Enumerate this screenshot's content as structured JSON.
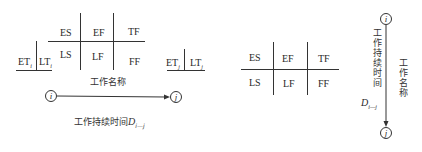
{
  "diagram_left": {
    "table_labels": {
      "es": "ES",
      "ef": "EF",
      "tf": "TF",
      "ls": "LS",
      "lf": "LF",
      "ff": "FF"
    },
    "node_i_times": {
      "et": "ET",
      "et_sub": "i",
      "lt": "LT",
      "lt_sub": "i"
    },
    "node_j_times": {
      "et": "ET",
      "et_sub": "j",
      "lt": "LT",
      "lt_sub": "j"
    },
    "work_name": "工作名称",
    "node_start": "i",
    "node_end": "j",
    "duration_label": "工作持续时间",
    "duration_symbol": "D",
    "duration_sub": "i—j"
  },
  "diagram_middle": {
    "table_labels": {
      "es": "ES",
      "ef": "EF",
      "tf": "TF",
      "ls": "LS",
      "lf": "LF",
      "ff": "FF"
    }
  },
  "diagram_right": {
    "node_start": "i",
    "node_end": "j",
    "duration_label": "工作持续时间",
    "duration_symbol": "D",
    "duration_sub": "i—j",
    "work_name": "工作名称"
  }
}
